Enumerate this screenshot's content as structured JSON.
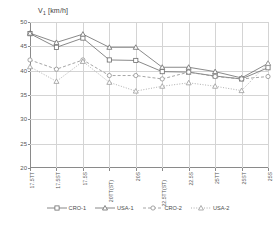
{
  "chart_data": {
    "type": "line",
    "title": "V1 [km/h]",
    "title_main": "V",
    "title_sub": "1",
    "title_unit": " [km/h]",
    "xlabel": "",
    "ylabel": "V1 [km/h]",
    "ylim": [
      20,
      50
    ],
    "ytick_values": [
      20,
      25,
      30,
      35,
      40,
      45,
      50
    ],
    "grid": true,
    "legend_position": "bottom",
    "categories": [
      "17.5TT",
      "17.5ST",
      "17.5S",
      "20TT(ST)",
      "20S",
      "22.5TT(ST)",
      "22.5S",
      "25TT",
      "25ST",
      "25S"
    ],
    "series": [
      {
        "name": "CRO-1",
        "marker": "square-open",
        "line": "solid",
        "color": "#6b6b6b",
        "values": [
          47.6,
          44.8,
          46.7,
          42.2,
          42.1,
          39.8,
          39.7,
          38.9,
          38.3,
          40.6
        ]
      },
      {
        "name": "USA-1",
        "marker": "triangle-open",
        "line": "solid",
        "color": "#6b6b6b",
        "values": [
          47.7,
          45.8,
          47.5,
          44.8,
          44.8,
          40.7,
          40.7,
          39.8,
          38.5,
          41.5
        ]
      },
      {
        "name": "CRO-2",
        "marker": "circle-open",
        "line": "dashed",
        "color": "#8f8f8f",
        "values": [
          42.2,
          40.3,
          42.2,
          39.0,
          39.0,
          38.3,
          39.7,
          38.8,
          38.3,
          38.8
        ]
      },
      {
        "name": "USA-2",
        "marker": "triangle-open",
        "line": "dotted",
        "color": "#9a9a9a",
        "values": [
          40.8,
          37.8,
          41.9,
          37.6,
          35.8,
          36.8,
          37.5,
          36.8,
          35.9,
          41.5
        ]
      }
    ]
  },
  "legend": {
    "items": [
      {
        "label": "CRO-1"
      },
      {
        "label": "USA-1"
      },
      {
        "label": "CRO-2"
      },
      {
        "label": "USA-2"
      }
    ]
  }
}
